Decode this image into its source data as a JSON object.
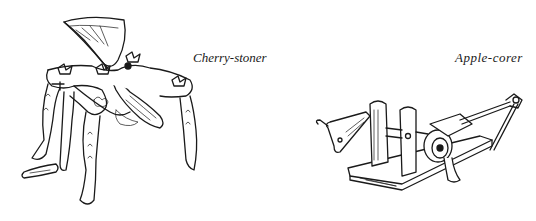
{
  "figures": [
    {
      "id": "cherry-stoner",
      "caption": "Cherry-stoner"
    },
    {
      "id": "apple-corer",
      "caption": "Apple-corer"
    }
  ],
  "colors": {
    "ink": "#1a1a1a",
    "paper": "#ffffff"
  }
}
